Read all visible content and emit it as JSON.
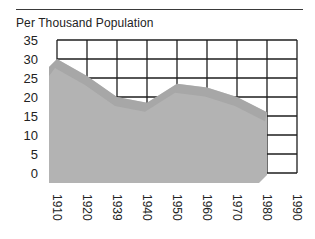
{
  "chart_data": {
    "type": "area",
    "title": "Per Thousand Population",
    "xlabel": "",
    "ylabel": "Per Thousand Population",
    "categories": [
      "1910",
      "1920",
      "1939",
      "1940",
      "1950",
      "1960",
      "1970",
      "1980",
      "1990"
    ],
    "series": [
      {
        "name": "Rate",
        "values": [
          30,
          25.5,
          20,
          18.5,
          23.5,
          22.5,
          20,
          16,
          null
        ]
      }
    ],
    "y_ticks": [
      "35",
      "30",
      "25",
      "20",
      "15",
      "10",
      "5",
      "0"
    ],
    "ylim": [
      0,
      35
    ],
    "grid": true,
    "legend": null
  },
  "colors": {
    "area_fill": "#b3b3b3",
    "area_top_band": "#9e9e9e",
    "grid": "#1e1e1e",
    "rule": "#3a3a3a"
  }
}
